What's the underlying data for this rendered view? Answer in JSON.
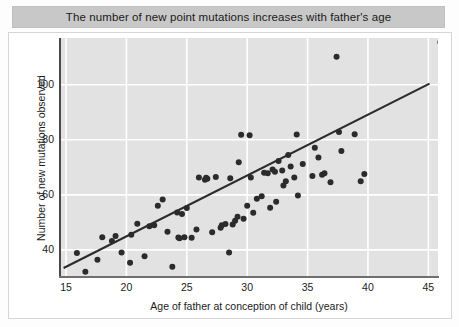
{
  "title": "The number of new point mutations increases with father's age",
  "axes": {
    "xlabel": "Age of father at conception of child (years)",
    "ylabel": "Number of new mutations observed",
    "xticks": [
      "15",
      "20",
      "25",
      "30",
      "35",
      "40",
      "45"
    ],
    "yticks": [
      "40",
      "60",
      "80",
      "100"
    ]
  },
  "colors": {
    "panel": "#e2e2e2",
    "grid": "#ffffff",
    "point": "#2b2b2b",
    "trendline": "#2b2b2b",
    "title_banner": "#c8c8c8",
    "text": "#1b1b1b"
  },
  "chart_data": {
    "type": "scatter",
    "title": "The number of new point mutations increases with father's age",
    "xlabel": "Age of father at conception of child (years)",
    "ylabel": "Number of new mutations observed",
    "xlim": [
      14.5,
      45.8
    ],
    "ylim": [
      30.5,
      117
    ],
    "grid": true,
    "legend": null,
    "xticks": [
      15,
      20,
      25,
      30,
      35,
      40,
      45
    ],
    "yticks": [
      40,
      60,
      80,
      100
    ],
    "trendline": {
      "type": "linear-fit",
      "x": [
        14.8,
        45.1
      ],
      "y": [
        33.4,
        100.4
      ]
    },
    "points": [
      {
        "x": 15.9,
        "y": 38.9
      },
      {
        "x": 16.6,
        "y": 32.0
      },
      {
        "x": 17.6,
        "y": 36.4
      },
      {
        "x": 18.0,
        "y": 44.6
      },
      {
        "x": 18.8,
        "y": 43.2
      },
      {
        "x": 19.1,
        "y": 45.0
      },
      {
        "x": 19.6,
        "y": 39.0
      },
      {
        "x": 20.3,
        "y": 35.3
      },
      {
        "x": 20.4,
        "y": 45.5
      },
      {
        "x": 20.9,
        "y": 49.5
      },
      {
        "x": 21.5,
        "y": 37.7
      },
      {
        "x": 21.9,
        "y": 48.6
      },
      {
        "x": 22.3,
        "y": 48.9
      },
      {
        "x": 22.6,
        "y": 56.0
      },
      {
        "x": 23.0,
        "y": 58.3
      },
      {
        "x": 23.4,
        "y": 46.6
      },
      {
        "x": 23.8,
        "y": 33.9
      },
      {
        "x": 24.2,
        "y": 53.6
      },
      {
        "x": 24.3,
        "y": 44.5
      },
      {
        "x": 24.4,
        "y": 44.2
      },
      {
        "x": 24.6,
        "y": 53.0
      },
      {
        "x": 24.8,
        "y": 44.6
      },
      {
        "x": 25.0,
        "y": 55.2
      },
      {
        "x": 25.4,
        "y": 44.4
      },
      {
        "x": 25.8,
        "y": 47.4
      },
      {
        "x": 26.0,
        "y": 66.3
      },
      {
        "x": 26.5,
        "y": 65.5
      },
      {
        "x": 26.6,
        "y": 66.2
      },
      {
        "x": 26.7,
        "y": 65.8
      },
      {
        "x": 27.1,
        "y": 46.4
      },
      {
        "x": 27.4,
        "y": 66.5
      },
      {
        "x": 27.8,
        "y": 48.0
      },
      {
        "x": 27.9,
        "y": 48.9
      },
      {
        "x": 28.2,
        "y": 49.4
      },
      {
        "x": 28.5,
        "y": 39.0
      },
      {
        "x": 28.6,
        "y": 66.0
      },
      {
        "x": 28.8,
        "y": 49.2
      },
      {
        "x": 29.0,
        "y": 50.6
      },
      {
        "x": 29.2,
        "y": 52.0
      },
      {
        "x": 29.3,
        "y": 71.8
      },
      {
        "x": 29.5,
        "y": 81.8
      },
      {
        "x": 29.7,
        "y": 51.3
      },
      {
        "x": 30.0,
        "y": 56.0
      },
      {
        "x": 30.2,
        "y": 81.7
      },
      {
        "x": 30.3,
        "y": 66.3
      },
      {
        "x": 30.5,
        "y": 53.5
      },
      {
        "x": 30.8,
        "y": 58.6
      },
      {
        "x": 31.2,
        "y": 59.5
      },
      {
        "x": 31.4,
        "y": 68.0
      },
      {
        "x": 31.7,
        "y": 67.8
      },
      {
        "x": 31.9,
        "y": 55.3
      },
      {
        "x": 32.1,
        "y": 69.2
      },
      {
        "x": 32.3,
        "y": 68.4
      },
      {
        "x": 32.4,
        "y": 57.5
      },
      {
        "x": 32.6,
        "y": 72.3
      },
      {
        "x": 32.9,
        "y": 68.8
      },
      {
        "x": 33.0,
        "y": 63.4
      },
      {
        "x": 33.2,
        "y": 64.9
      },
      {
        "x": 33.4,
        "y": 74.5
      },
      {
        "x": 33.6,
        "y": 70.3
      },
      {
        "x": 33.9,
        "y": 66.3
      },
      {
        "x": 34.1,
        "y": 81.9
      },
      {
        "x": 34.2,
        "y": 59.8
      },
      {
        "x": 34.6,
        "y": 71.2
      },
      {
        "x": 35.4,
        "y": 66.8
      },
      {
        "x": 35.6,
        "y": 77.1
      },
      {
        "x": 35.9,
        "y": 73.6
      },
      {
        "x": 36.2,
        "y": 67.3
      },
      {
        "x": 36.4,
        "y": 67.8
      },
      {
        "x": 36.9,
        "y": 64.6
      },
      {
        "x": 37.4,
        "y": 110.2
      },
      {
        "x": 37.6,
        "y": 82.8
      },
      {
        "x": 37.8,
        "y": 75.9
      },
      {
        "x": 38.9,
        "y": 82.0
      },
      {
        "x": 39.4,
        "y": 64.9
      },
      {
        "x": 39.7,
        "y": 67.6
      },
      {
        "x": 46.0,
        "y": 115.5
      }
    ]
  }
}
